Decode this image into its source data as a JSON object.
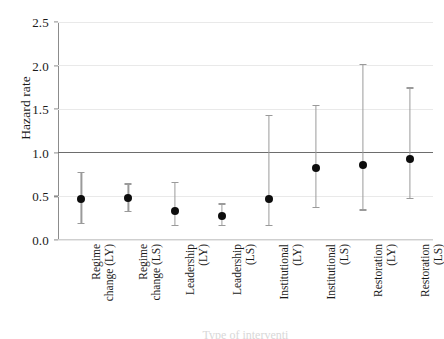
{
  "chart_data": {
    "type": "scatter",
    "title": "",
    "xlabel": "Type of interventi",
    "ylabel": "Hazard rate",
    "ylim": [
      0.0,
      2.5
    ],
    "yticks": [
      "0.0",
      "0.5",
      "1.0",
      "1.5",
      "2.0",
      "2.5"
    ],
    "ytick_values": [
      0.0,
      0.5,
      1.0,
      1.5,
      2.0,
      2.5
    ],
    "grid": "horizontal",
    "legend": "none",
    "reference_line": 1.0,
    "categories": [
      "Regime change (LY)",
      "Regime change (LS)",
      "Leadership (LY)",
      "Leadership (LS)",
      "Institutional (LY)",
      "Institutional (LS)",
      "Restoration (LY)",
      "Restoration (LS)"
    ],
    "category_lines": [
      [
        "Regime",
        "change (LY)"
      ],
      [
        "Regime",
        "change (LS)"
      ],
      [
        "Leadership",
        "(LY)"
      ],
      [
        "Leadership",
        "(LS)"
      ],
      [
        "Institutional",
        "(LY)"
      ],
      [
        "Institutional",
        "(LS)"
      ],
      [
        "Restoration",
        "(LY)"
      ],
      [
        "Restoration",
        "(LS)"
      ]
    ],
    "values": [
      0.47,
      0.48,
      0.33,
      0.28,
      0.47,
      0.83,
      0.86,
      0.93
    ],
    "ci_low": [
      0.2,
      0.33,
      0.17,
      0.17,
      0.17,
      0.38,
      0.35,
      0.48
    ],
    "ci_high": [
      0.78,
      0.65,
      0.67,
      0.42,
      1.43,
      1.55,
      2.02,
      1.75
    ],
    "colors": {
      "marker": "#0d0d0d",
      "errorbar": "#9a9a9a",
      "gridline": "#e9e9e9",
      "reference_line": "#6d6d6d",
      "axis": "#8c8c8c",
      "background": "#ffffff"
    }
  }
}
